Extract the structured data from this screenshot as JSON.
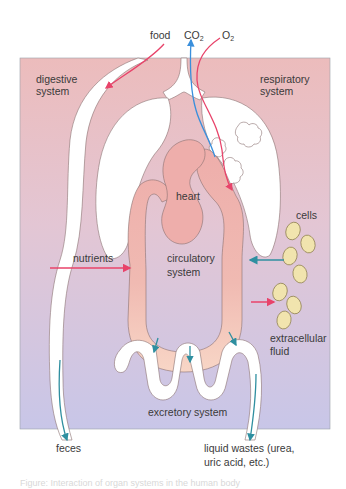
{
  "diagram": {
    "colors": {
      "bg_top": "#ecbcbc",
      "bg_mid": "#e3c8d6",
      "bg_bottom": "#c9c6e6",
      "organ_fill": "#ffffff",
      "outline": "#8a7070",
      "vessel_fill": "#eeb0ad",
      "vessel_bottom": "#f6d1c4",
      "arrow_red": "#e8436a",
      "arrow_blue": "#3a8fdc",
      "arrow_teal": "#2f8fa0",
      "cell_fill": "#f1e4ae",
      "cell_stroke": "#8a7b4a"
    },
    "labels": {
      "food": "food",
      "co2_main": "CO",
      "co2_sub": "2",
      "o2_main": "O",
      "o2_sub": "2",
      "digestive_1": "digestive",
      "digestive_2": "system",
      "respiratory_1": "respiratory",
      "respiratory_2": "system",
      "heart": "heart",
      "cells": "cells",
      "nutrients": "nutrients",
      "circulatory_1": "circulatory",
      "circulatory_2": "system",
      "extracellular_1": "extracellular",
      "extracellular_2": "fluid",
      "excretory": "excretory system",
      "feces": "feces",
      "liquid_1": "liquid wastes (urea,",
      "liquid_2": "uric acid, etc.)"
    },
    "caption": "Figure: Interaction of organ systems in the human body"
  }
}
